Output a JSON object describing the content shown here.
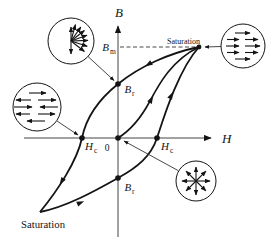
{
  "axes": {
    "y_label": "B",
    "x_label": "H",
    "origin_label": "0"
  },
  "points": {
    "b_m": {
      "base": "B",
      "sub": "m"
    },
    "b_r_top": {
      "base": "B",
      "sub": "r"
    },
    "b_r_bottom": {
      "base": "B",
      "sub": "r"
    },
    "h_c_left": {
      "base": "H",
      "sub": "c"
    },
    "h_c_right": {
      "base": "H",
      "sub": "c"
    }
  },
  "labels": {
    "saturation_top": "Saturation",
    "saturation_bottom": "Saturation"
  },
  "domain_circles": {
    "top_left": {
      "icon": "domains-fan-arrows-icon",
      "state": "partially aligned, fanning toward field"
    },
    "top_right": {
      "icon": "domains-aligned-right-icon",
      "state": "fully aligned at saturation"
    },
    "middle_left": {
      "icon": "domains-mixed-left-right-icon",
      "state": "mixed opposing domains at coercivity"
    },
    "bottom_right": {
      "icon": "domains-radial-arrows-icon",
      "state": "random radial domains at origin"
    }
  },
  "colors": {
    "line": "#141414",
    "background": "#ffffff"
  }
}
